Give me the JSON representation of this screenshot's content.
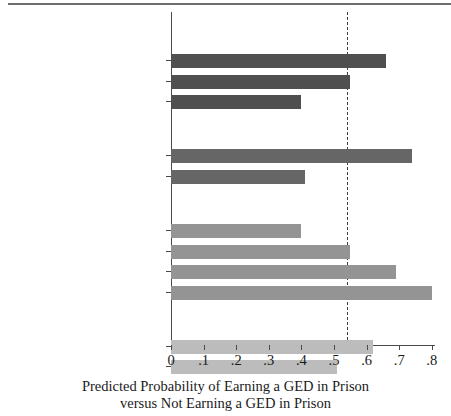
{
  "chart_data": {
    "type": "bar",
    "orientation": "horizontal",
    "title": "",
    "xlabel_line1": "Predicted Probability of Earning a GED in Prison",
    "xlabel_line2": "versus Not Earning a GED in Prison",
    "ylabel": "",
    "xlim": [
      0,
      0.84
    ],
    "xticks": [
      0,
      0.1,
      0.2,
      0.3,
      0.4,
      0.5,
      0.6,
      0.7,
      0.8
    ],
    "xticklabels": [
      "0",
      ".1",
      ".2",
      ".3",
      ".4",
      ".5",
      ".6",
      ".7",
      ".8"
    ],
    "grid": false,
    "legend": "none",
    "reference_line": {
      "value": 0.54,
      "style": "dashed",
      "color": "#3d3d3d"
    },
    "groups": [
      {
        "name": "Age at 2003 Entrance",
        "color": "#4f4f4f",
        "categories": [
          "Eighteen",
          "Twenty-one",
          "Twenty-five"
        ],
        "values": [
          0.66,
          0.55,
          0.4
        ]
      },
      {
        "name": "Race",
        "color": "#666666",
        "categories": [
          "White",
          "Black"
        ],
        "values": [
          0.74,
          0.41
        ]
      },
      {
        "name": "Years in Prison",
        "color": "#949494",
        "categories": [
          "One year",
          "Two years",
          "Three years",
          "Four years"
        ],
        "values": [
          0.4,
          0.55,
          0.69,
          0.8
        ]
      },
      {
        "name": "Prison Management Level",
        "color": "#bcbcbc",
        "categories": [
          "Level 1 or 2",
          "Level 3 or higher"
        ],
        "values": [
          0.62,
          0.51
        ]
      }
    ]
  },
  "axis": {
    "x_origin_px": 171,
    "x_span_px": 326
  }
}
